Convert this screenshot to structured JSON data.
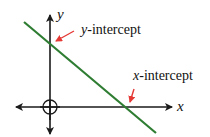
{
  "diagram": {
    "axes": {
      "x_label": "x",
      "y_label": "y",
      "axis_color": "#1a1a1a"
    },
    "line": {
      "color": "#2e7d32",
      "description": "line with negative slope"
    },
    "annotations": [
      {
        "var": "y",
        "suffix": "-intercept",
        "arrow_color": "#e53935"
      },
      {
        "var": "x",
        "suffix": "-intercept",
        "arrow_color": "#e53935"
      }
    ],
    "origin_marker": "circle-crosshair"
  }
}
